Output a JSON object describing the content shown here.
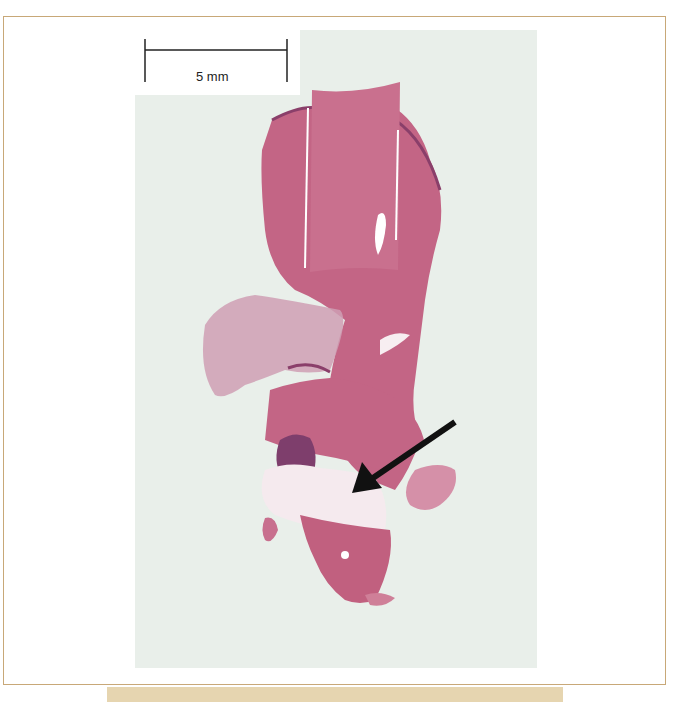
{
  "figure": {
    "type": "histology-micrograph",
    "stain_colors": {
      "tissue": "#c0607c",
      "tissue_light": "#d98ca0",
      "tissue_dark": "#8a3f6a",
      "background_slide": "#e9efea",
      "arrow": "#111111",
      "frame_border": "#c8a878",
      "band": "#e6d5b0"
    },
    "scale_bar": {
      "label": "5 mm"
    },
    "annotation": {
      "arrow": "arrow pointing to pale region in lower tissue"
    }
  }
}
